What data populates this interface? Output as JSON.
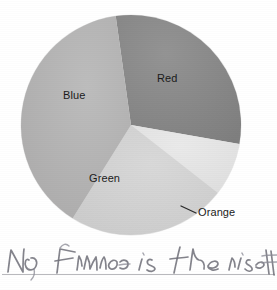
{
  "document": {
    "kind": "scanned-pie-chart-with-handwritten-note",
    "background_color": "#ffffff"
  },
  "chart_data": {
    "type": "pie",
    "title": "",
    "subtitle": "",
    "xlabel": "",
    "ylabel": "",
    "grid": false,
    "legend_position": "none",
    "labels_inside_slices": true,
    "categories": [
      "Red",
      "Orange",
      "Green",
      "Blue"
    ],
    "values": [
      30,
      8,
      23,
      39
    ],
    "units": "percent",
    "start_angle_deg": -8,
    "direction": "clockwise",
    "center_px": {
      "x": 131,
      "y": 125
    },
    "radius_px": 110,
    "slices": [
      {
        "label": "Red",
        "value": 30,
        "color": "#8a8a8a",
        "start_deg": -8,
        "end_deg": 100,
        "label_placement": "inside",
        "leader_line": false
      },
      {
        "label": "Orange",
        "value": 8,
        "color": "#e4e4e4",
        "start_deg": 100,
        "end_deg": 128,
        "label_placement": "outside",
        "leader_line": true
      },
      {
        "label": "Green",
        "value": 23,
        "color": "#d2d2d2",
        "start_deg": 128,
        "end_deg": 212,
        "label_placement": "inside",
        "leader_line": false
      },
      {
        "label": "Blue",
        "value": 39,
        "color": "#b5b5b5",
        "start_deg": 212,
        "end_deg": 352,
        "label_placement": "inside",
        "leader_line": false
      }
    ]
  },
  "labels": {
    "red": "Red",
    "orange": "Orange",
    "green": "Green",
    "blue": "Blue"
  },
  "annotation": {
    "handwritten_text": "No, France is the rise",
    "truncated_at_right_edge": true,
    "ink_color": "#6e6e78",
    "rule_line_color": "#b9b9bd"
  }
}
